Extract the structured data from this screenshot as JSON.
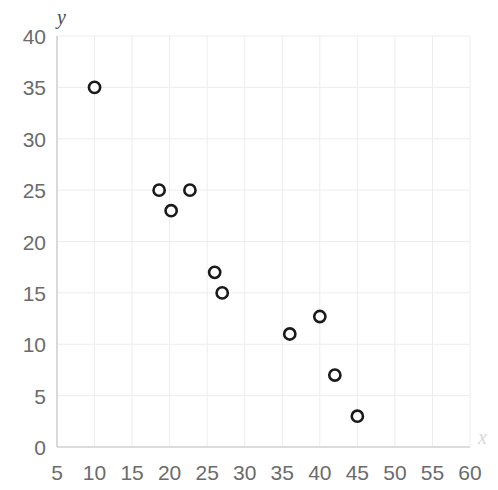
{
  "chart_data": {
    "type": "scatter",
    "title": "",
    "subtitle": "",
    "xlabel": "x",
    "ylabel": "y",
    "xlim": [
      5,
      60
    ],
    "ylim": [
      0,
      40
    ],
    "xticks": [
      5,
      10,
      15,
      20,
      25,
      30,
      35,
      40,
      45,
      50,
      55,
      60
    ],
    "yticks": [
      0,
      5,
      10,
      15,
      20,
      25,
      30,
      35,
      40
    ],
    "xtick_labels": [
      "5",
      "10",
      "15",
      "20",
      "25",
      "30",
      "35",
      "40",
      "45",
      "50",
      "55",
      "60"
    ],
    "ytick_labels": [
      "0",
      "5",
      "10",
      "15",
      "20",
      "25",
      "30",
      "35",
      "40"
    ],
    "grid": true,
    "legend": false,
    "legend_position": "none",
    "marker": "open-circle",
    "marker_edge_color": "#1a1a1a",
    "marker_face_color": "#ffffff",
    "grid_color": "#ededed",
    "axis_color": "#d0d0d0",
    "background_color": "#ffffff",
    "tick_label_color": "#6b6b6b",
    "points": [
      {
        "x": 10,
        "y": 35
      },
      {
        "x": 18.6,
        "y": 25
      },
      {
        "x": 20.2,
        "y": 23
      },
      {
        "x": 22.7,
        "y": 25
      },
      {
        "x": 26,
        "y": 17
      },
      {
        "x": 27,
        "y": 15
      },
      {
        "x": 36,
        "y": 11
      },
      {
        "x": 40,
        "y": 12.7
      },
      {
        "x": 42,
        "y": 7
      },
      {
        "x": 45,
        "y": 3
      }
    ],
    "series": [
      {
        "name": "series-1",
        "x": [
          10,
          18.6,
          20.2,
          22.7,
          26,
          27,
          36,
          40,
          42,
          45
        ],
        "values": [
          35,
          25,
          23,
          25,
          17,
          15,
          11,
          12.7,
          7,
          3
        ]
      }
    ]
  }
}
